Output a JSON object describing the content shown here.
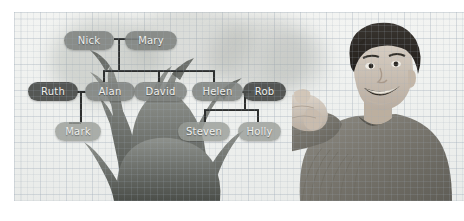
{
  "image": {
    "kind": "photo-illustration",
    "caption_subject": "family-tree-diagram-over-tree-photo-with-boy",
    "background": "graph-paper",
    "accent_dark": "#4a4d4a",
    "accent_mid": "#7e827e",
    "accent_light": "#989c96",
    "line_color": "#2d2f2e"
  },
  "diagram": {
    "nodes": [
      {
        "id": "nick",
        "label": "Nick",
        "x": 64,
        "y": 31,
        "w": 50,
        "tone": "mid"
      },
      {
        "id": "mary",
        "label": "Mary",
        "x": 125,
        "y": 31,
        "w": 52,
        "tone": "mid"
      },
      {
        "id": "ruth",
        "label": "Ruth",
        "x": 28,
        "y": 82,
        "w": 50,
        "tone": "dark"
      },
      {
        "id": "alan",
        "label": "Alan",
        "x": 85,
        "y": 82,
        "w": 50,
        "tone": "mid"
      },
      {
        "id": "david",
        "label": "David",
        "x": 134,
        "y": 82,
        "w": 53,
        "tone": "mid"
      },
      {
        "id": "helen",
        "label": "Helen",
        "x": 192,
        "y": 82,
        "w": 51,
        "tone": "mid"
      },
      {
        "id": "rob",
        "label": "Rob",
        "x": 243,
        "y": 82,
        "w": 43,
        "tone": "dark"
      },
      {
        "id": "mark",
        "label": "Mark",
        "x": 55,
        "y": 122,
        "w": 46,
        "tone": "light"
      },
      {
        "id": "steven",
        "label": "Steven",
        "x": 178,
        "y": 122,
        "w": 52,
        "tone": "light"
      },
      {
        "id": "holly",
        "label": "Holly",
        "x": 238,
        "y": 122,
        "w": 43,
        "tone": "light"
      }
    ],
    "relations": [
      {
        "type": "marriage",
        "from": "nick",
        "to": "mary"
      },
      {
        "type": "marriage",
        "from": "ruth",
        "to": "alan"
      },
      {
        "type": "marriage",
        "from": "helen",
        "to": "rob"
      },
      {
        "type": "child",
        "from": "nick-mary",
        "to": "alan"
      },
      {
        "type": "child",
        "from": "nick-mary",
        "to": "david"
      },
      {
        "type": "child",
        "from": "nick-mary",
        "to": "helen"
      },
      {
        "type": "child",
        "from": "ruth-alan",
        "to": "mark"
      },
      {
        "type": "child",
        "from": "helen-rob",
        "to": "steven"
      },
      {
        "type": "child",
        "from": "helen-rob",
        "to": "holly"
      }
    ]
  },
  "photo": {
    "subject": "smiling-boy-pointing-thumb-at-himself",
    "tree": "leafless-tree-silhouette"
  }
}
